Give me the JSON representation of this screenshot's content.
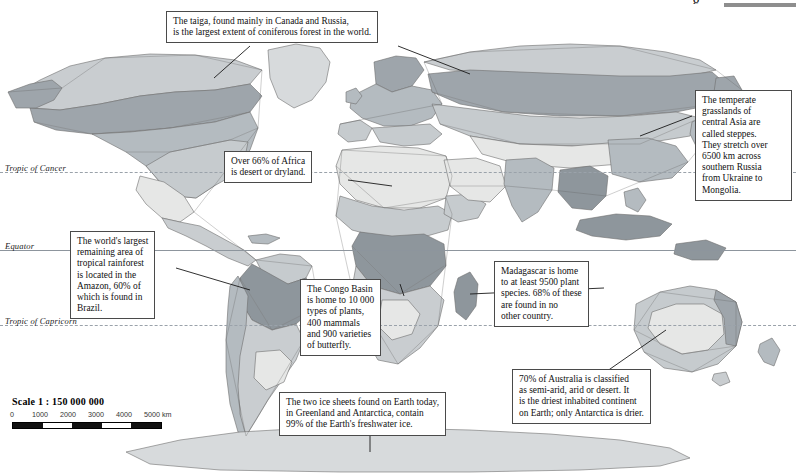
{
  "map": {
    "projection_note": "world biomes map, grayscale",
    "latitudes": [
      {
        "name": "tropic-of-cancer",
        "label": "Tropic of Cancer",
        "y": 172,
        "style": "dashed"
      },
      {
        "name": "equator",
        "label": "Equator",
        "y": 250,
        "style": "solid"
      },
      {
        "name": "tropic-of-capricorn",
        "label": "Tropic of Capricorn",
        "y": 325,
        "style": "dashed"
      }
    ]
  },
  "scale": {
    "title": "Scale 1 : 150 000 000",
    "unit": "km",
    "ticks": [
      "0",
      "1000",
      "2000",
      "3000",
      "4000",
      "5000 km"
    ]
  },
  "callouts": [
    {
      "name": "callout-taiga",
      "lines": [
        "The taiga, found mainly in Canada and Russia,",
        "is the largest extent of coniferous forest in the world."
      ]
    },
    {
      "name": "callout-steppes",
      "lines": [
        "The temperate",
        "grasslands of",
        "central Asia are",
        "called steppes.",
        "They stretch over",
        "6500 km across",
        "southern Russia",
        "from Ukraine to",
        "Mongolia."
      ]
    },
    {
      "name": "callout-africa-desert",
      "lines": [
        "Over 66% of Africa",
        "is desert or dryland."
      ]
    },
    {
      "name": "callout-amazon",
      "lines": [
        "The world's largest",
        "remaining area of",
        "tropical rainforest",
        "is located in the",
        "Amazon, 60% of",
        "which is found in",
        "Brazil."
      ]
    },
    {
      "name": "callout-congo-basin",
      "lines": [
        "The Congo Basin",
        "is home to 10 000",
        "types of plants,",
        "400 mammals",
        "and 900 varieties",
        "of butterfly."
      ]
    },
    {
      "name": "callout-madagascar",
      "lines": [
        "Madagascar is home",
        "to at least 9500 plant",
        "species. 68% of these",
        "are found in no",
        "other country."
      ]
    },
    {
      "name": "callout-ice-sheets",
      "lines": [
        "The two ice sheets found on Earth today,",
        "in Greenland and Antarctica, contain",
        "99% of the Earth's freshwater ice."
      ]
    },
    {
      "name": "callout-australia",
      "lines": [
        "70% of Australia is classified",
        "as semi-arid, arid or desert. It",
        "is the driest inhabited continent",
        "on Earth; only Antarctica is drier."
      ]
    }
  ],
  "colors": {
    "ocean": "#ffffff",
    "tundra": "#c9cdd0",
    "taiga": "#9ea5ab",
    "temperate_forest": "#b4bbc0",
    "grassland": "#c6cbce",
    "desert": "#e6e7e6",
    "tropical_forest": "#8e969c",
    "ice": "#d7dadc",
    "coastline": "#6e6e6e",
    "callout_border": "#4a4a4a",
    "leader_line": "#1a1a1a"
  }
}
